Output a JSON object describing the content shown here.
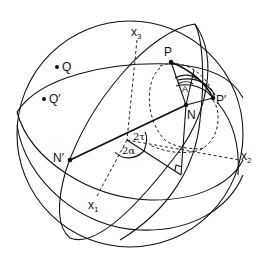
{
  "diagram": {
    "type": "spherical-geometry",
    "colors": {
      "ink": "#111111",
      "background": "#ffffff"
    },
    "points": {
      "P": {
        "label": "P"
      },
      "P_prime": {
        "label": "P′"
      },
      "N": {
        "label": "N"
      },
      "N_prime": {
        "label": "N′"
      },
      "Q": {
        "label": "Q"
      },
      "Q_prime": {
        "label": "Q′"
      }
    },
    "axes": {
      "x1": {
        "base": "x",
        "sub": "1"
      },
      "x2": {
        "base": "x",
        "sub": "2"
      },
      "x3": {
        "base": "x",
        "sub": "3"
      }
    },
    "angles": {
      "A": "A",
      "two_tau": "2τ",
      "two_alpha": "2α"
    }
  }
}
